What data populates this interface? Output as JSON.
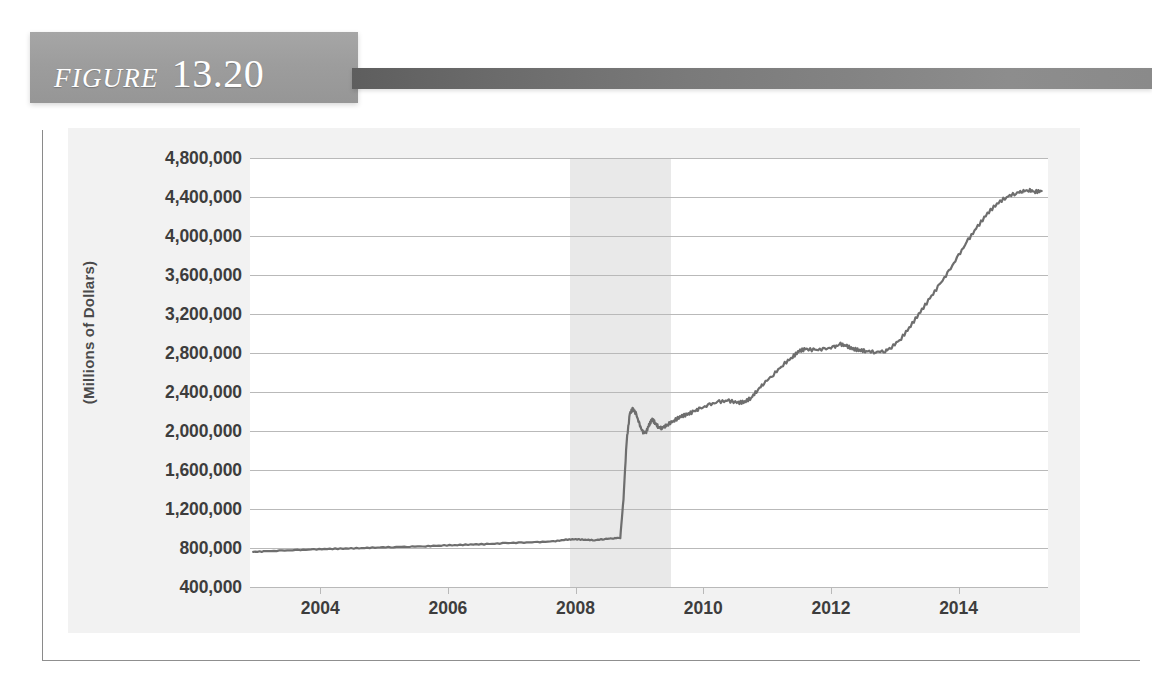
{
  "figure": {
    "word": "FIGURE",
    "number": "13.20"
  },
  "chart_data": {
    "type": "line",
    "title": "",
    "xlabel": "",
    "ylabel": "(Millions of Dollars)",
    "grid": true,
    "legend": false,
    "xlim": [
      2002.9,
      2015.4
    ],
    "ylim": [
      400000,
      4800000
    ],
    "y_ticks": [
      "4,800,000",
      "4,400,000",
      "4,000,000",
      "3,600,000",
      "3,200,000",
      "2,800,000",
      "2,400,000",
      "2,000,000",
      "1,600,000",
      "1,200,000",
      "800,000",
      "400,000"
    ],
    "y_tick_values": [
      4800000,
      4400000,
      4000000,
      3600000,
      3200000,
      2800000,
      2400000,
      2000000,
      1600000,
      1200000,
      800000,
      400000
    ],
    "x_ticks": [
      "2004",
      "2006",
      "2008",
      "2010",
      "2012",
      "2014"
    ],
    "x_tick_values": [
      2004,
      2006,
      2008,
      2010,
      2012,
      2014
    ],
    "shaded_regions": [
      {
        "name": "recession",
        "x_start": 2007.92,
        "x_end": 2009.5,
        "color": "#e9e9e9"
      }
    ],
    "series": [
      {
        "name": "Total Assets of the Federal Reserve",
        "color": "#6e6e6e",
        "x": [
          2002.95,
          2003.15,
          2003.4,
          2003.65,
          2003.9,
          2004.15,
          2004.4,
          2004.65,
          2004.9,
          2005.15,
          2005.4,
          2005.65,
          2005.9,
          2006.15,
          2006.4,
          2006.65,
          2006.9,
          2007.15,
          2007.4,
          2007.65,
          2007.85,
          2008.0,
          2008.15,
          2008.3,
          2008.45,
          2008.6,
          2008.7,
          2008.75,
          2008.8,
          2008.85,
          2008.9,
          2008.95,
          2009.0,
          2009.05,
          2009.1,
          2009.15,
          2009.2,
          2009.25,
          2009.3,
          2009.35,
          2009.4,
          2009.45,
          2009.55,
          2009.65,
          2009.75,
          2009.85,
          2009.95,
          2010.1,
          2010.25,
          2010.4,
          2010.55,
          2010.65,
          2010.75,
          2010.85,
          2010.95,
          2011.1,
          2011.25,
          2011.4,
          2011.5,
          2011.6,
          2011.75,
          2011.9,
          2012.05,
          2012.15,
          2012.25,
          2012.35,
          2012.45,
          2012.55,
          2012.7,
          2012.85,
          2012.95,
          2013.1,
          2013.25,
          2013.4,
          2013.55,
          2013.7,
          2013.85,
          2014.0,
          2014.15,
          2014.3,
          2014.45,
          2014.6,
          2014.75,
          2014.9,
          2015.0,
          2015.1,
          2015.2,
          2015.3
        ],
        "y": [
          760000,
          766000,
          773000,
          779000,
          786000,
          790000,
          795000,
          799000,
          806000,
          810000,
          814000,
          818000,
          826000,
          830000,
          836000,
          841000,
          850000,
          855000,
          860000,
          868000,
          885000,
          890000,
          885000,
          880000,
          892000,
          900000,
          905000,
          1300000,
          1900000,
          2180000,
          2230000,
          2170000,
          2070000,
          1990000,
          1980000,
          2060000,
          2120000,
          2080000,
          2040000,
          2030000,
          2050000,
          2070000,
          2110000,
          2150000,
          2170000,
          2200000,
          2230000,
          2270000,
          2300000,
          2310000,
          2290000,
          2300000,
          2340000,
          2420000,
          2490000,
          2580000,
          2680000,
          2760000,
          2820000,
          2840000,
          2830000,
          2840000,
          2860000,
          2890000,
          2870000,
          2840000,
          2830000,
          2820000,
          2810000,
          2820000,
          2860000,
          2950000,
          3080000,
          3220000,
          3360000,
          3500000,
          3640000,
          3800000,
          3960000,
          4100000,
          4230000,
          4330000,
          4400000,
          4440000,
          4460000,
          4470000,
          4455000,
          4460000
        ]
      }
    ]
  }
}
